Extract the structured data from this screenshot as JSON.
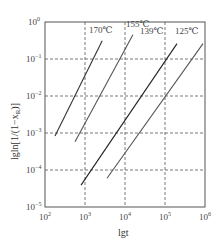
{
  "chart_data": {
    "type": "line",
    "title": "",
    "xlabel": "lgt",
    "ylabel": "lgln[1/(1−x_R)]",
    "xscale": "log",
    "yscale": "log",
    "xlim": [
      100,
      1000000
    ],
    "ylim": [
      1e-05,
      1
    ],
    "grid": true,
    "grid_style": "dashed",
    "legend": "inline labels at line tops",
    "x_ticks": [
      "10^2",
      "10^3",
      "10^4",
      "10^5",
      "10^6"
    ],
    "y_ticks": [
      "10^0",
      "10^-1",
      "10^-2",
      "10^-3",
      "10^-4",
      "10^-5"
    ],
    "series": [
      {
        "name": "170℃",
        "x": [
          178,
          2690
        ],
        "y": [
          0.00083,
          0.31
        ],
        "color": "#333333"
      },
      {
        "name": "155℃",
        "x": [
          562,
          15800
        ],
        "y": [
          0.00058,
          0.45
        ],
        "color": "#555555"
      },
      {
        "name": "139℃",
        "x": [
          794,
          200000
        ],
        "y": [
          3.9e-05,
          0.26
        ],
        "color": "#222222"
      },
      {
        "name": "125℃",
        "x": [
          3550,
          890000
        ],
        "y": [
          6e-05,
          0.26
        ],
        "color": "#555555"
      }
    ]
  },
  "labels": {
    "x_axis_title": "lgt",
    "y_axis_title": "lgln[1/(1−x",
    "y_axis_sub": "R",
    "y_axis_tail": ")]",
    "x_ticks": [
      {
        "base": "10",
        "exp": "2"
      },
      {
        "base": "10",
        "exp": "3"
      },
      {
        "base": "10",
        "exp": "4"
      },
      {
        "base": "10",
        "exp": "5"
      },
      {
        "base": "10",
        "exp": "6"
      }
    ],
    "y_ticks": [
      {
        "base": "10",
        "exp": "0"
      },
      {
        "base": "10",
        "exp": "−1"
      },
      {
        "base": "10",
        "exp": "−2"
      },
      {
        "base": "10",
        "exp": "−3"
      },
      {
        "base": "10",
        "exp": "−4"
      },
      {
        "base": "10",
        "exp": "−5"
      }
    ],
    "series_labels": [
      "170℃",
      "155℃",
      "139℃",
      "125℃"
    ]
  }
}
